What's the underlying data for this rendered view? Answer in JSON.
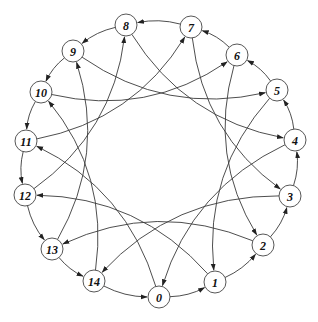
{
  "diagram": {
    "type": "directed-graph",
    "layout": "circular",
    "node_radius": 11,
    "colors": {
      "edge": "#3a3a3a",
      "node_stroke": "#444444",
      "node_fill": "#ffffff",
      "label": "#111111"
    },
    "nodes": [
      {
        "id": 0,
        "label": "0",
        "x": 159,
        "y": 297
      },
      {
        "id": 1,
        "label": "1",
        "x": 215,
        "y": 282
      },
      {
        "id": 2,
        "label": "2",
        "x": 263,
        "y": 245
      },
      {
        "id": 3,
        "label": "3",
        "x": 290,
        "y": 196
      },
      {
        "id": 4,
        "label": "4",
        "x": 295,
        "y": 140
      },
      {
        "id": 5,
        "label": "5",
        "x": 277,
        "y": 90
      },
      {
        "id": 6,
        "label": "6",
        "x": 237,
        "y": 55
      },
      {
        "id": 7,
        "label": "7",
        "x": 191,
        "y": 27
      },
      {
        "id": 8,
        "label": "8",
        "x": 126,
        "y": 25
      },
      {
        "id": 9,
        "label": "9",
        "x": 73,
        "y": 51
      },
      {
        "id": 10,
        "label": "10",
        "x": 41,
        "y": 92
      },
      {
        "id": 11,
        "label": "11",
        "x": 26,
        "y": 141
      },
      {
        "id": 12,
        "label": "12",
        "x": 25,
        "y": 195
      },
      {
        "id": 13,
        "label": "13",
        "x": 52,
        "y": 249
      },
      {
        "id": 14,
        "label": "14",
        "x": 94,
        "y": 281
      }
    ],
    "edges": [
      {
        "from": 0,
        "to": 1,
        "kind": "ring"
      },
      {
        "from": 1,
        "to": 2,
        "kind": "ring"
      },
      {
        "from": 2,
        "to": 3,
        "kind": "ring"
      },
      {
        "from": 3,
        "to": 4,
        "kind": "ring"
      },
      {
        "from": 4,
        "to": 5,
        "kind": "ring"
      },
      {
        "from": 5,
        "to": 6,
        "kind": "ring"
      },
      {
        "from": 6,
        "to": 7,
        "kind": "ring"
      },
      {
        "from": 7,
        "to": 8,
        "kind": "ring"
      },
      {
        "from": 8,
        "to": 9,
        "kind": "ring"
      },
      {
        "from": 9,
        "to": 10,
        "kind": "ring"
      },
      {
        "from": 10,
        "to": 11,
        "kind": "ring"
      },
      {
        "from": 11,
        "to": 12,
        "kind": "ring"
      },
      {
        "from": 12,
        "to": 13,
        "kind": "ring"
      },
      {
        "from": 13,
        "to": 14,
        "kind": "ring"
      },
      {
        "from": 14,
        "to": 0,
        "kind": "ring"
      },
      {
        "from": 0,
        "to": 11,
        "kind": "chord"
      },
      {
        "from": 1,
        "to": 12,
        "kind": "chord"
      },
      {
        "from": 2,
        "to": 13,
        "kind": "chord"
      },
      {
        "from": 3,
        "to": 14,
        "kind": "chord"
      },
      {
        "from": 4,
        "to": 0,
        "kind": "chord"
      },
      {
        "from": 5,
        "to": 1,
        "kind": "chord"
      },
      {
        "from": 6,
        "to": 2,
        "kind": "chord"
      },
      {
        "from": 7,
        "to": 3,
        "kind": "chord"
      },
      {
        "from": 8,
        "to": 4,
        "kind": "chord"
      },
      {
        "from": 9,
        "to": 5,
        "kind": "chord"
      },
      {
        "from": 10,
        "to": 6,
        "kind": "chord"
      },
      {
        "from": 11,
        "to": 7,
        "kind": "chord"
      },
      {
        "from": 12,
        "to": 8,
        "kind": "chord"
      },
      {
        "from": 13,
        "to": 9,
        "kind": "chord"
      },
      {
        "from": 14,
        "to": 10,
        "kind": "chord"
      }
    ]
  }
}
